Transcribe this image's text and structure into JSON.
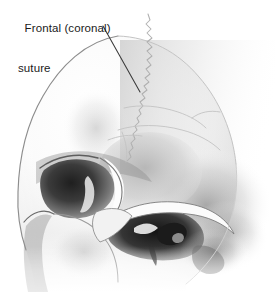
{
  "figure": {
    "view": "lateral (side) view, facing left",
    "rendering_style": "grayscale airbrush / pencil medical illustration",
    "background_color": "#ffffff"
  },
  "annotations": [
    {
      "id": "frontal-coronal-suture",
      "line1": "Frontal (coronal)",
      "line2": "suture",
      "text_color": "#1a1a1a",
      "font_size_px": 11.5,
      "text_position": {
        "x": 18,
        "y": 8
      },
      "leader_line": {
        "style": "thin dark line",
        "color": "#3a3a3a",
        "start": {
          "x": 103,
          "y": 26
        },
        "end": {
          "x": 140,
          "y": 92
        }
      }
    }
  ],
  "anatomy": {
    "structures": [
      "frontal bone",
      "parietal bone",
      "coronal suture",
      "temporal bone",
      "sphenoid (greater wing)",
      "orbit (eye socket)",
      "supraorbital margin / brow ridge",
      "zygomatic bone",
      "zygomatic arch",
      "external acoustic meatus",
      "mastoid process",
      "maxilla",
      "nasal aperture"
    ]
  },
  "palette": {
    "background": "#ffffff",
    "bone_light": "#f4f4f4",
    "bone_mid": "#d9d9d9",
    "bone_shadow": "#9a9a9a",
    "deep_shadow": "#2c2c2c",
    "suture_line": "#b9b9b9",
    "outline": "#8f8f8f",
    "label_text": "#1a1a1a",
    "leader_line": "#3a3a3a"
  }
}
